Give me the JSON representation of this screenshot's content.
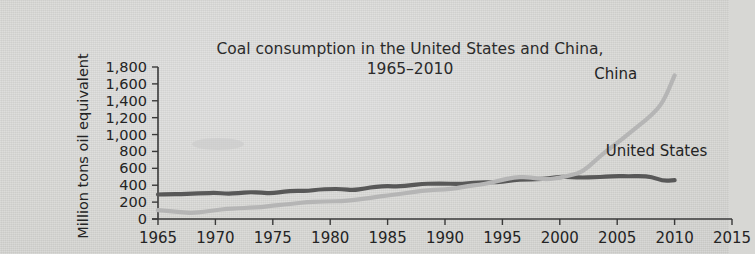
{
  "chart_data": {
    "type": "line",
    "title": "Coal consumption in the United States and China,",
    "subtitle": "1965–2010",
    "xlabel": "",
    "ylabel": "Million tons oil equivalent",
    "xlim": [
      1965,
      2015
    ],
    "ylim": [
      0,
      1800
    ],
    "xticks": [
      "1965",
      "1970",
      "1975",
      "1980",
      "1985",
      "1990",
      "1995",
      "2000",
      "2005",
      "2010",
      "2015"
    ],
    "xtick_values": [
      1965,
      1970,
      1975,
      1980,
      1985,
      1990,
      1995,
      2000,
      2005,
      2010,
      2015
    ],
    "yticks": [
      "0",
      "200",
      "400",
      "600",
      "800",
      "1,000",
      "1,200",
      "1,400",
      "1,600",
      "1,800"
    ],
    "ytick_values": [
      0,
      200,
      400,
      600,
      800,
      1000,
      1200,
      1400,
      1600,
      1800
    ],
    "grid": false,
    "legend_position": "inline-annotations",
    "x": [
      1965,
      1966,
      1967,
      1968,
      1969,
      1970,
      1971,
      1972,
      1973,
      1974,
      1975,
      1976,
      1977,
      1978,
      1979,
      1980,
      1981,
      1982,
      1983,
      1984,
      1985,
      1986,
      1987,
      1988,
      1989,
      1990,
      1991,
      1992,
      1993,
      1994,
      1995,
      1996,
      1997,
      1998,
      1999,
      2000,
      2001,
      2002,
      2003,
      2004,
      2005,
      2006,
      2007,
      2008,
      2009,
      2010
    ],
    "series": [
      {
        "name": "United States",
        "color": "#585858",
        "label_x": 2004,
        "label_y": 800,
        "values": [
          290,
          295,
          295,
          300,
          305,
          310,
          300,
          305,
          320,
          310,
          305,
          325,
          335,
          330,
          350,
          355,
          355,
          340,
          360,
          385,
          390,
          385,
          400,
          415,
          420,
          420,
          415,
          420,
          435,
          435,
          440,
          460,
          470,
          470,
          480,
          500,
          495,
          490,
          495,
          500,
          510,
          505,
          510,
          500,
          450,
          460
        ],
        "peak": {
          "year": 2000,
          "value": 545
        },
        "dip": {
          "year": 2009,
          "value": 450
        }
      },
      {
        "name": "China",
        "color": "#b5b5b5",
        "label_x": 2003,
        "label_y": 1720,
        "values": [
          105,
          95,
          80,
          70,
          85,
          105,
          120,
          125,
          135,
          140,
          160,
          170,
          185,
          200,
          205,
          210,
          210,
          225,
          240,
          260,
          280,
          295,
          315,
          335,
          345,
          350,
          365,
          390,
          405,
          430,
          465,
          490,
          500,
          480,
          470,
          490,
          520,
          560,
          680,
          800,
          900,
          1010,
          1120,
          1230,
          1380,
          1700
        ],
        "plateau": {
          "start_year": 1996,
          "end_year": 2001,
          "value": 660
        },
        "steep_rise_start": 2002
      }
    ],
    "annotations": [
      {
        "text": "China",
        "x": 2003,
        "y": 1720
      },
      {
        "text": "United States",
        "x": 2004,
        "y": 800
      }
    ]
  },
  "figure": {
    "background_color": "#d6d6d3",
    "axis_color": "#3a3a3a",
    "text_color": "#242424"
  }
}
